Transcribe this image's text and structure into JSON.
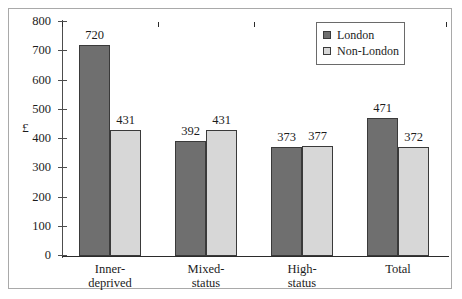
{
  "chart_data": {
    "type": "bar",
    "title": "",
    "xlabel": "",
    "ylabel": "£",
    "ylim": [
      0,
      800
    ],
    "ytick_step": 100,
    "yticks": [
      "800",
      "700",
      "600",
      "500",
      "400",
      "300",
      "200",
      "100",
      "0"
    ],
    "grid": false,
    "legend_position": "top-right",
    "categories": [
      "Inner-\ndeprived",
      "Mixed-\nstatus",
      "High-\nstatus",
      "Total"
    ],
    "series": [
      {
        "name": "London",
        "color": "#6f6f6f",
        "values": [
          720,
          392,
          373,
          471
        ],
        "labels": [
          "720",
          "392",
          "373",
          "471"
        ]
      },
      {
        "name": "Non-London",
        "color": "#d7d7d7",
        "values": [
          431,
          431,
          377,
          372
        ],
        "labels": [
          "431",
          "431",
          "377",
          "372"
        ]
      }
    ]
  },
  "legend": {
    "items": [
      {
        "label": "London",
        "swatch": "london"
      },
      {
        "label": "Non-London",
        "swatch": "nonlondon"
      }
    ]
  }
}
